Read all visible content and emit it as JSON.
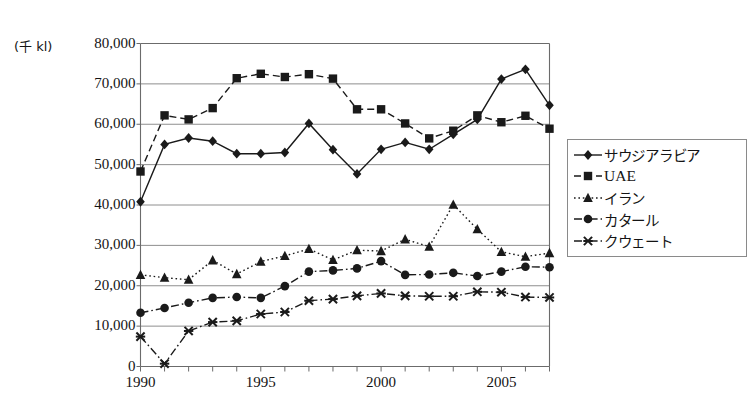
{
  "chart_data": {
    "type": "line",
    "title": "",
    "xlabel": "",
    "ylabel": "(千 kl)",
    "ylim": [
      0,
      80000
    ],
    "ytick_step": 10000,
    "ytick_labels": [
      "80,000",
      "70,000",
      "60,000",
      "50,000",
      "40,000",
      "30,000",
      "20,000",
      "10,000",
      "0"
    ],
    "xlim": [
      1990,
      2007
    ],
    "x": [
      1990,
      1991,
      1992,
      1993,
      1994,
      1995,
      1996,
      1997,
      1998,
      1999,
      2000,
      2001,
      2002,
      2003,
      2004,
      2005,
      2006,
      2007
    ],
    "xtick_labels": [
      "1990",
      "1995",
      "2000",
      "2005"
    ],
    "xtick_values": [
      1990,
      1995,
      2000,
      2005
    ],
    "grid": "horizontal",
    "legend_position": "right-middle",
    "series": [
      {
        "name": "サウジアラビア",
        "marker": "diamond",
        "line": "solid",
        "color": "#1a1a1a",
        "values": [
          40800,
          55000,
          56600,
          55800,
          52700,
          52700,
          53000,
          60200,
          53700,
          47700,
          53800,
          55500,
          53800,
          57500,
          61200,
          71200,
          73600,
          64700
        ]
      },
      {
        "name": "UAE",
        "marker": "square",
        "line": "dashed",
        "color": "#1a1a1a",
        "values": [
          48300,
          62200,
          61200,
          64000,
          71400,
          72500,
          71700,
          72400,
          71300,
          63700,
          63700,
          60200,
          56500,
          58400,
          62200,
          60500,
          62100,
          58900
        ]
      },
      {
        "name": "イラン",
        "marker": "triangle",
        "line": "dotted",
        "color": "#1a1a1a",
        "values": [
          22700,
          22000,
          21500,
          26300,
          22900,
          26000,
          27400,
          29100,
          26400,
          28800,
          28600,
          31500,
          29700,
          40100,
          34000,
          28400,
          27200,
          28100
        ]
      },
      {
        "name": "カタール",
        "marker": "circle",
        "line": "dashdot",
        "color": "#1a1a1a",
        "values": [
          13300,
          14500,
          15800,
          17000,
          17200,
          17000,
          19900,
          23500,
          23800,
          24300,
          26100,
          22700,
          22800,
          23200,
          22400,
          23500,
          24700,
          24600
        ]
      },
      {
        "name": "クウェート",
        "marker": "x",
        "line": "dashdot",
        "color": "#1a1a1a",
        "values": [
          7400,
          700,
          8800,
          11000,
          11300,
          13000,
          13500,
          16300,
          16700,
          17500,
          18100,
          17500,
          17400,
          17400,
          18500,
          18400,
          17200,
          17100
        ]
      }
    ]
  },
  "legend": {
    "items": [
      {
        "label": "サウジアラビア",
        "marker": "diamond",
        "line": "solid"
      },
      {
        "label": "UAE",
        "marker": "square",
        "line": "dashed"
      },
      {
        "label": "イラン",
        "marker": "triangle",
        "line": "dotted"
      },
      {
        "label": "カタール",
        "marker": "circle",
        "line": "dashdot"
      },
      {
        "label": "クウェート",
        "marker": "x",
        "line": "dashdot"
      }
    ]
  }
}
